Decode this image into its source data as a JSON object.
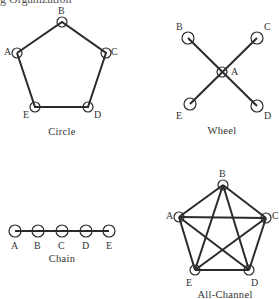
{
  "header": {
    "partial_title": "g Organization"
  },
  "networks": {
    "circle": {
      "name": "Circle",
      "nodes": [
        "A",
        "B",
        "C",
        "D",
        "E"
      ]
    },
    "wheel": {
      "name": "Wheel",
      "center": "A",
      "nodes": [
        "A",
        "B",
        "C",
        "D",
        "E"
      ]
    },
    "chain": {
      "name": "Chain",
      "nodes": [
        "A",
        "B",
        "C",
        "D",
        "E"
      ]
    },
    "all_channel": {
      "name": "All-Channel",
      "nodes": [
        "A",
        "B",
        "C",
        "D",
        "E"
      ]
    }
  },
  "labels": {
    "A": "A",
    "B": "B",
    "C": "C",
    "D": "D",
    "E": "E"
  },
  "colors": {
    "line": "#2a2a2a",
    "node": "#2a2a2a"
  }
}
